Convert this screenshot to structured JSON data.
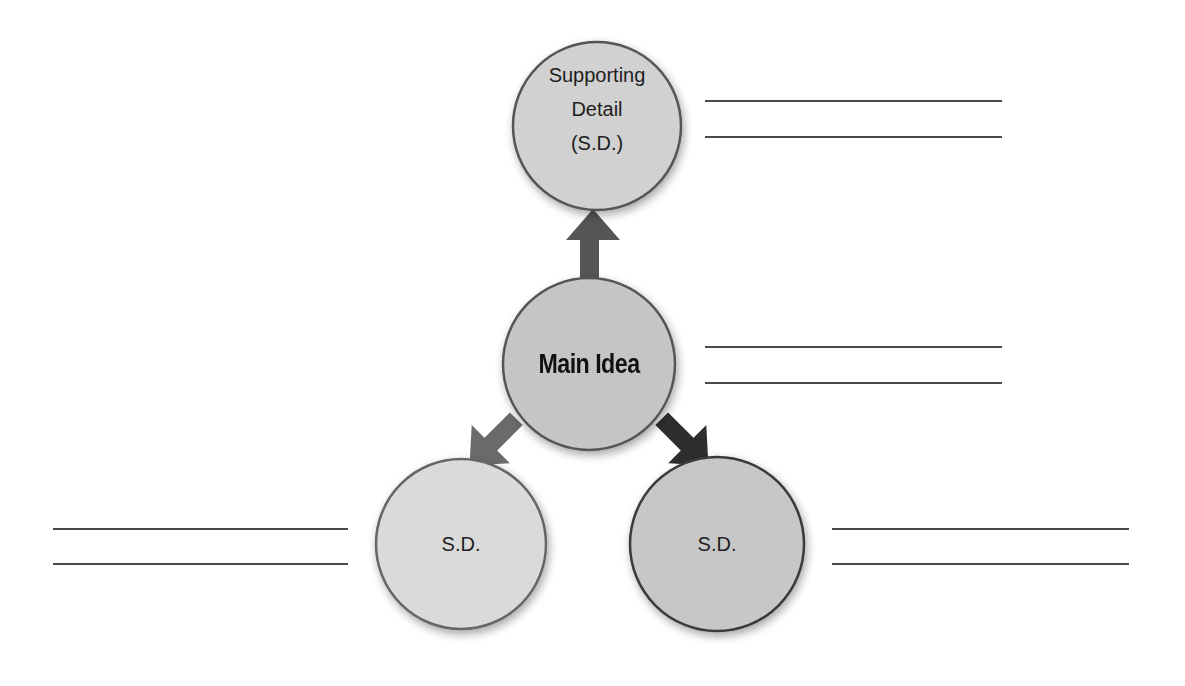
{
  "diagram": {
    "type": "main-idea-supporting-details-web",
    "nodes": {
      "top": {
        "label_lines": [
          "Supporting",
          "Detail",
          "(S.D.)"
        ],
        "fill": "#d1d1d1"
      },
      "main": {
        "label": "Main Idea",
        "fill": "#c5c5c5"
      },
      "left": {
        "label": "S.D.",
        "fill": "#dadada"
      },
      "right": {
        "label": "S.D.",
        "fill": "#c7c7c7"
      }
    },
    "arrows": [
      {
        "from": "main",
        "to": "top",
        "color": "#555555"
      },
      {
        "from": "main",
        "to": "left",
        "color": "#6a6a6a"
      },
      {
        "from": "main",
        "to": "right",
        "color": "#2e2e2e"
      }
    ],
    "answer_lines": {
      "top": 2,
      "main": 2,
      "left": 2,
      "right": 2
    },
    "border_color": "#555555",
    "line_color": "#4a4a4a"
  }
}
